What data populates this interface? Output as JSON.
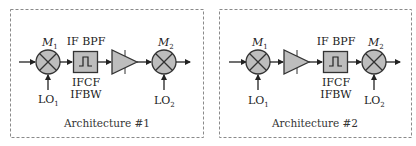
{
  "diagram": {
    "colors": {
      "block_fill": "#bdbdbd",
      "stroke": "#333333",
      "frame": "#8a8a8a",
      "background": "#ffffff"
    },
    "architectures": [
      {
        "caption": "Architecture #1",
        "chain": [
          "mixer M1",
          "IF BPF",
          "amplifier",
          "mixer M2"
        ],
        "mixer1": {
          "label": "M",
          "sub": "1",
          "lo_label": "LO",
          "lo_sub": "1"
        },
        "filter": {
          "label": "IF BPF",
          "param1": "IFCF",
          "param2": "IFBW"
        },
        "mixer2": {
          "label": "M",
          "sub": "2",
          "lo_label": "LO",
          "lo_sub": "2"
        }
      },
      {
        "caption": "Architecture #2",
        "chain": [
          "mixer M1",
          "amplifier",
          "IF BPF",
          "mixer M2"
        ],
        "mixer1": {
          "label": "M",
          "sub": "1",
          "lo_label": "LO",
          "lo_sub": "1"
        },
        "filter": {
          "label": "IF BPF",
          "param1": "IFCF",
          "param2": "IFBW"
        },
        "mixer2": {
          "label": "M",
          "sub": "2",
          "lo_label": "LO",
          "lo_sub": "2"
        }
      }
    ]
  }
}
